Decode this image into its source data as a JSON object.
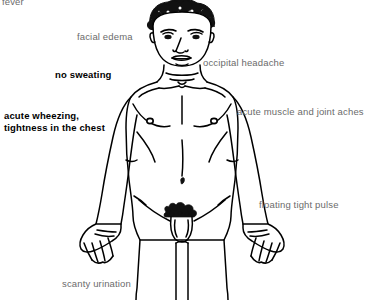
{
  "diagram": {
    "background_color": "#ffffff",
    "line_color": "#000000",
    "label_color": "#6b6b6b",
    "emphasis_color": "#000000",
    "figure": "anterior-male-body-line-drawing"
  },
  "labels": [
    {
      "id": "fever",
      "text": "fever",
      "emphasis": false,
      "clipped": true,
      "x": 2,
      "y": -4
    },
    {
      "id": "facial-edema",
      "text": "facial edema",
      "emphasis": false,
      "clipped": false,
      "x": 77,
      "y": 31
    },
    {
      "id": "occipital-headache",
      "text": "occipital headache",
      "emphasis": false,
      "clipped": false,
      "x": 203,
      "y": 57
    },
    {
      "id": "no-sweating",
      "text": "no sweating",
      "emphasis": true,
      "clipped": false,
      "x": 55,
      "y": 69
    },
    {
      "id": "acute-muscle-and-joint-aches",
      "text": "acute muscle and joint aches",
      "emphasis": false,
      "clipped": false,
      "x": 237,
      "y": 106
    },
    {
      "id": "acute-wheezing-tightness-in-the-chest",
      "text": "acute wheezing,\ntightness in the chest",
      "emphasis": true,
      "clipped": false,
      "x": 4,
      "y": 110
    },
    {
      "id": "floating-tight-pulse",
      "text": "floating tight pulse",
      "emphasis": false,
      "clipped": false,
      "x": 259,
      "y": 199
    },
    {
      "id": "scanty-urination",
      "text": "scanty urination",
      "emphasis": false,
      "clipped": false,
      "x": 62,
      "y": 278
    }
  ]
}
